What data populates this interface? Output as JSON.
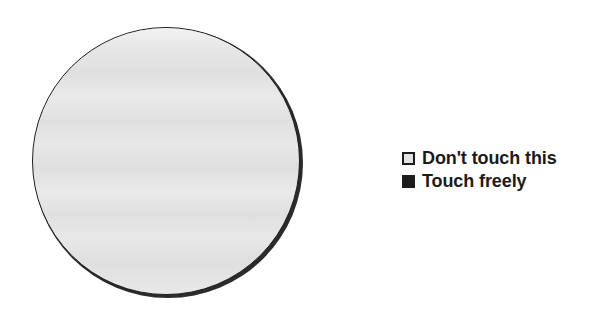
{
  "figure": {
    "background_color": "#ffffff",
    "shape": {
      "name": "circle",
      "fill_color": "#e3e3e3",
      "outline_color": "#1c1c1c",
      "shadow_color": "#2b2b2b",
      "label": ""
    }
  },
  "legend": {
    "items": [
      {
        "label": "Don't touch this",
        "swatch_style": "light",
        "swatch_fill": "#e3e3e3",
        "swatch_border": "#1c1c1c"
      },
      {
        "label": "Touch freely",
        "swatch_style": "dark",
        "swatch_fill": "#1c1c1c",
        "swatch_border": "#1c1c1c"
      }
    ]
  }
}
